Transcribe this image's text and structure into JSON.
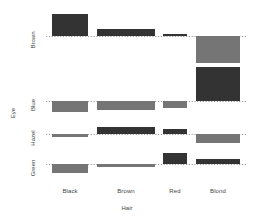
{
  "chart_data": {
    "type": "bar",
    "chart_kind": "association-plot",
    "title": "",
    "xlabel": "Hair",
    "ylabel": "Eye",
    "categories": [
      "Black",
      "Brown",
      "Red",
      "Blond"
    ],
    "rows": [
      "Brown",
      "Blue",
      "Hazel",
      "Green"
    ],
    "grid": true,
    "grid_style": "dotted-baseline-per-row",
    "legend": "none",
    "colors": {
      "positive_fill": "#333333",
      "negative_fill": "#757575",
      "baseline": "#9a9a9a",
      "text": "#444444",
      "background": "#ffffff"
    },
    "series": [
      {
        "name": "Brown",
        "values": [
          4.4,
          1.2,
          0.1,
          -5.85
        ],
        "signs": [
          "positive",
          "positive",
          "positive",
          "negative"
        ]
      },
      {
        "name": "Blue",
        "values": [
          -3.07,
          -1.95,
          -1.73,
          7.05
        ],
        "signs": [
          "negative",
          "negative",
          "negative",
          "positive"
        ]
      },
      {
        "name": "Hazel",
        "values": [
          -0.48,
          1.35,
          0.85,
          -2.23
        ],
        "signs": [
          "negative",
          "positive",
          "positive",
          "negative"
        ]
      },
      {
        "name": "Green",
        "values": [
          -1.95,
          -0.35,
          2.28,
          0.61
        ],
        "signs": [
          "negative",
          "negative",
          "positive",
          "positive"
        ]
      }
    ],
    "column_widths_note": "bar width proportional to sqrt(expected count)",
    "bar_geometry": [
      {
        "row": "Brown",
        "baseline_y": 36,
        "bars": [
          {
            "cat": "Black",
            "x": 52,
            "w": 36,
            "top": 14,
            "h": 22,
            "dir": "up",
            "fill": "#333333"
          },
          {
            "cat": "Brown",
            "x": 97,
            "w": 58,
            "top": 29,
            "h": 7,
            "dir": "up",
            "fill": "#333333"
          },
          {
            "cat": "Red",
            "x": 163,
            "w": 24,
            "top": 34,
            "h": 2,
            "dir": "up",
            "fill": "#333333"
          },
          {
            "cat": "Blond",
            "x": 196,
            "w": 44,
            "top": 36,
            "h": 27,
            "dir": "down",
            "fill": "#757575"
          }
        ]
      },
      {
        "row": "Blue",
        "baseline_y": 101,
        "bars": [
          {
            "cat": "Black",
            "x": 52,
            "w": 36,
            "top": 101,
            "h": 11,
            "dir": "down",
            "fill": "#757575"
          },
          {
            "cat": "Brown",
            "x": 97,
            "w": 58,
            "top": 101,
            "h": 9,
            "dir": "down",
            "fill": "#757575"
          },
          {
            "cat": "Red",
            "x": 163,
            "w": 24,
            "top": 101,
            "h": 7,
            "dir": "down",
            "fill": "#757575"
          },
          {
            "cat": "Blond",
            "x": 196,
            "w": 44,
            "top": 67,
            "h": 34,
            "dir": "up",
            "fill": "#333333"
          }
        ]
      },
      {
        "row": "Hazel",
        "baseline_y": 134,
        "bars": [
          {
            "cat": "Black",
            "x": 52,
            "w": 36,
            "top": 134,
            "h": 3,
            "dir": "down",
            "fill": "#757575"
          },
          {
            "cat": "Brown",
            "x": 97,
            "w": 58,
            "top": 127,
            "h": 7,
            "dir": "up",
            "fill": "#333333"
          },
          {
            "cat": "Red",
            "x": 163,
            "w": 24,
            "top": 129,
            "h": 5,
            "dir": "up",
            "fill": "#333333"
          },
          {
            "cat": "Blond",
            "x": 196,
            "w": 44,
            "top": 134,
            "h": 9,
            "dir": "down",
            "fill": "#757575"
          }
        ]
      },
      {
        "row": "Green",
        "baseline_y": 164,
        "bars": [
          {
            "cat": "Black",
            "x": 52,
            "w": 36,
            "top": 164,
            "h": 9,
            "dir": "down",
            "fill": "#757575"
          },
          {
            "cat": "Brown",
            "x": 97,
            "w": 58,
            "top": 164,
            "h": 3,
            "dir": "down",
            "fill": "#757575"
          },
          {
            "cat": "Red",
            "x": 163,
            "w": 24,
            "top": 153,
            "h": 11,
            "dir": "up",
            "fill": "#333333"
          },
          {
            "cat": "Blond",
            "x": 196,
            "w": 44,
            "top": 159,
            "h": 5,
            "dir": "up",
            "fill": "#333333"
          }
        ]
      }
    ],
    "baselines": [
      {
        "row": "Brown",
        "y": 36,
        "x1": 46,
        "x2": 246
      },
      {
        "row": "Blue",
        "y": 101,
        "x1": 46,
        "x2": 246
      },
      {
        "row": "Hazel",
        "y": 134,
        "x1": 46,
        "x2": 246
      },
      {
        "row": "Green",
        "y": 164,
        "x1": 46,
        "x2": 246
      }
    ],
    "x_tick_positions": [
      70,
      126,
      175,
      218
    ],
    "y_tick_positions": [
      36,
      101,
      134,
      164
    ]
  },
  "labels": {
    "x_ticks": [
      "Black",
      "Brown",
      "Red",
      "Blond"
    ],
    "y_ticks": [
      "Brown",
      "Blue",
      "Hazel",
      "Green"
    ],
    "x_axis_title": "Hair",
    "y_axis_title": "Eye"
  }
}
